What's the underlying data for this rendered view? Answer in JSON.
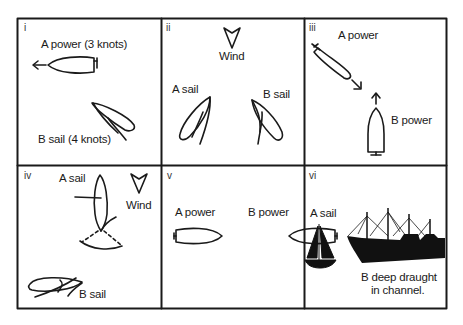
{
  "diagram": {
    "type": "rule-of-the-road vessel encounter panels",
    "grid": {
      "rows": 2,
      "cols": 3
    },
    "panels": [
      {
        "id": "i",
        "labels": {
          "a": "A power (3 knots)",
          "b": "B sail (4 knots)"
        }
      },
      {
        "id": "ii",
        "labels": {
          "wind": "Wind",
          "a": "A sail",
          "b": "B sail"
        }
      },
      {
        "id": "iii",
        "labels": {
          "a": "A power",
          "b": "B power"
        }
      },
      {
        "id": "iv",
        "labels": {
          "a": "A sail",
          "wind": "Wind",
          "b": "B sail"
        }
      },
      {
        "id": "v",
        "labels": {
          "a": "A power",
          "b": "B power"
        }
      },
      {
        "id": "vi",
        "labels": {
          "a": "A sail",
          "b_line1": "B deep draught",
          "b_line2": "in channel."
        }
      }
    ],
    "colors": {
      "ink": "#1a1a1a",
      "background": "#ffffff"
    }
  }
}
